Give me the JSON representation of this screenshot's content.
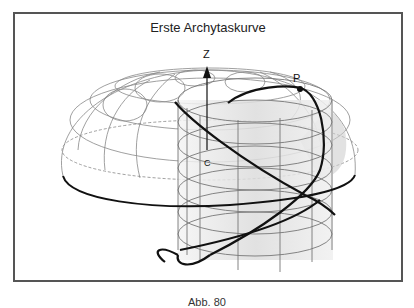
{
  "figure": {
    "title": "Erste Archytaskurve",
    "labels": {
      "z_axis": "Z",
      "point": "P",
      "center": "C"
    },
    "caption": "Abb. 80"
  },
  "colors": {
    "frame": "#555555",
    "curve": "#111111",
    "wireframe": "#777777",
    "shading": "#d9d9d9"
  }
}
